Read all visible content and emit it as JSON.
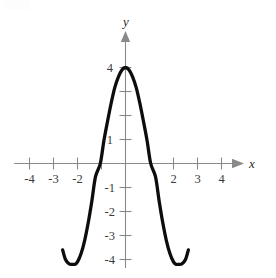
{
  "chart_data": {
    "type": "line",
    "title": "",
    "subtitle": "",
    "xlabel": "x",
    "ylabel": "y",
    "xlim": [
      -4.8,
      4.8
    ],
    "ylim": [
      -4.7,
      4.7
    ],
    "grid": false,
    "legend": null,
    "axis_style": "cartesian-cross-with-arrows",
    "x_ticks": [
      -4,
      -3,
      -2,
      -1,
      1,
      2,
      3,
      4
    ],
    "x_tick_labels": [
      "-4",
      "-3",
      "-2",
      "",
      "",
      "2",
      "3",
      "4"
    ],
    "y_ticks": [
      -4,
      -3,
      -2,
      -1,
      1,
      2,
      3,
      4
    ],
    "y_tick_labels": [
      "-4",
      "-3",
      "-2",
      "-1",
      "1",
      "",
      "",
      "4"
    ],
    "series": [
      {
        "name": "curve",
        "color": "#0d0d0d",
        "maximum": {
          "x": 0,
          "y": 4
        },
        "local_minima": [
          {
            "x": -2.1,
            "y": -4.2
          },
          {
            "x": 2.1,
            "y": -4.2
          }
        ],
        "x_intercepts": [
          -1.05,
          1.05
        ],
        "y_intercept": 4,
        "domain_drawn": [
          -2.62,
          2.62
        ],
        "x": [
          -2.62,
          -2.5,
          -2.35,
          -2.2,
          -2.1,
          -2.0,
          -1.85,
          -1.7,
          -1.55,
          -1.4,
          -1.25,
          -1.05,
          -0.9,
          -0.75,
          -0.6,
          -0.45,
          -0.3,
          -0.15,
          0,
          0.15,
          0.3,
          0.45,
          0.6,
          0.75,
          0.9,
          1.05,
          1.25,
          1.4,
          1.55,
          1.7,
          1.85,
          2.0,
          2.1,
          2.2,
          2.35,
          2.5,
          2.62
        ],
        "y": [
          -3.6,
          -4.0,
          -4.18,
          -4.2,
          -4.2,
          -4.1,
          -3.75,
          -3.2,
          -2.45,
          -1.55,
          -0.55,
          0,
          0.95,
          1.75,
          2.5,
          3.15,
          3.6,
          3.9,
          4.0,
          3.9,
          3.6,
          3.15,
          2.5,
          1.75,
          0.95,
          0,
          -0.55,
          -1.55,
          -2.45,
          -3.2,
          -3.75,
          -4.1,
          -4.2,
          -4.2,
          -4.18,
          -4.0,
          -3.6
        ]
      }
    ]
  },
  "labels": {
    "x_axis_name": "x",
    "y_axis_name": "y"
  }
}
